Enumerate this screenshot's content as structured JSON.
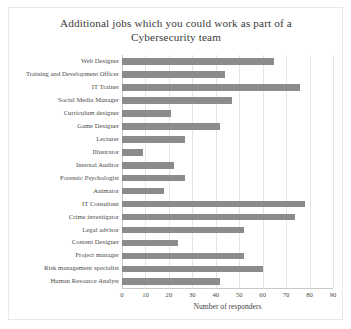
{
  "chart_data": {
    "type": "bar",
    "orientation": "horizontal",
    "title": "Additional jobs which you could work as part of a Cybersecurity team",
    "title_line1": "Additional jobs which  you could work as part of a",
    "title_line2": "Cybersecurity team",
    "xlabel": "Number of responders",
    "ylabel": "",
    "xlim": [
      0,
      90
    ],
    "xticks": [
      0,
      10,
      20,
      30,
      40,
      50,
      60,
      70,
      80,
      90
    ],
    "grid": "vertical",
    "legend": "none",
    "bar_color": "#8b8b8b",
    "categories": [
      "Web Designer",
      "Training and Development Officer",
      "IT Trainer",
      "Social Media Manager",
      "Curriculum designer",
      "Game Designer",
      "Lecturer",
      "Illustrator",
      "Internal Auditor",
      "Forensic Psychologist",
      "Animator",
      "IT Consultant",
      "Crime investigator",
      "Legal advisor",
      "Content Designer",
      "Project manager",
      "Risk management specialist",
      "Human Resource Analyst"
    ],
    "values": [
      65,
      44,
      76,
      47,
      21,
      42,
      27,
      9,
      22,
      27,
      18,
      78,
      74,
      52,
      24,
      52,
      60,
      42
    ]
  }
}
